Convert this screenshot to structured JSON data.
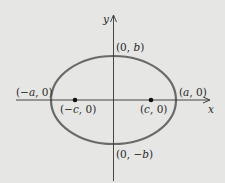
{
  "diagram": {
    "type": "ellipse",
    "colors": {
      "background": "#e6e6e4",
      "ellipse_stroke": "#6a6a6a",
      "axis": "#333333",
      "point": "#111111",
      "text": "#2a2a2a"
    },
    "axes": {
      "x_label": "x",
      "y_label": "y"
    },
    "vertices": [
      {
        "label_pre": "(",
        "label_var": "a",
        "label_post": ", 0)",
        "full": "(a, 0)"
      },
      {
        "label_pre": "(−",
        "label_var": "a",
        "label_post": ", 0)",
        "full": "(−a, 0)"
      }
    ],
    "co_vertices": [
      {
        "label_pre": "(0, ",
        "label_var": "b",
        "label_post": ")",
        "full": "(0, b)"
      },
      {
        "label_pre": "(0, −",
        "label_var": "b",
        "label_post": ")",
        "full": "(0, −b)"
      }
    ],
    "foci": [
      {
        "label_pre": "(",
        "label_var": "c",
        "label_post": ", 0)",
        "full": "(c, 0)"
      },
      {
        "label_pre": "(−",
        "label_var": "c",
        "label_post": ", 0)",
        "full": "(−c, 0)"
      }
    ]
  }
}
